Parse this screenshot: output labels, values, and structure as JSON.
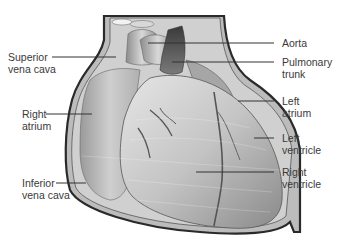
{
  "diagram": {
    "labels": {
      "superior_vena_cava": "Superior\nvena cava",
      "right_atrium": "Right\natrium",
      "inferior_vena_cava": "Inferior\nvena cava",
      "aorta": "Aorta",
      "pulmonary_trunk": "Pulmonary\ntrunk",
      "left_atrium": "Left\natrium",
      "left_ventricle": "Left\nventricle",
      "right_ventricle": "Right\nventricle"
    },
    "colors": {
      "label_text": "#3a3a3a",
      "leader_line": "#333333",
      "pericardium_outline": "#2a2a2a",
      "tissue_light": "#d4d4d4",
      "tissue_mid": "#a8a8a8",
      "tissue_dark": "#5a5a5a",
      "background": "#ffffff"
    }
  }
}
